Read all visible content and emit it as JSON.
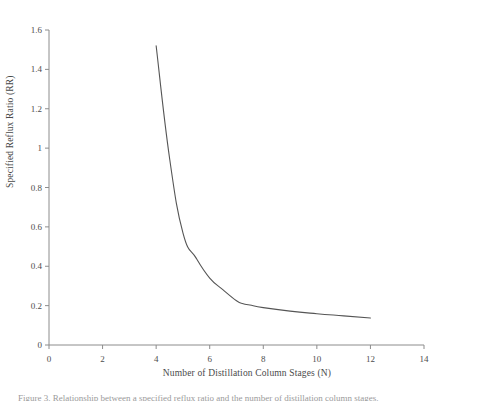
{
  "chart_data": {
    "type": "line",
    "title": "",
    "xlabel": "Number of Distillation Column Stages (N)",
    "ylabel": "Specified Reflux Ratio (RR)",
    "xlim": [
      0,
      14
    ],
    "ylim": [
      0,
      1.6
    ],
    "xticks": [
      "0",
      "2",
      "4",
      "6",
      "8",
      "10",
      "12",
      "14"
    ],
    "xtick_values": [
      0,
      2,
      4,
      6,
      8,
      10,
      12,
      14
    ],
    "yticks": [
      "0",
      "0.2",
      "0.4",
      "0.6",
      "0.8",
      "1",
      "1.2",
      "1.4",
      "1.6"
    ],
    "ytick_values": [
      0,
      0.2,
      0.4,
      0.6,
      0.8,
      1,
      1.2,
      1.4,
      1.6
    ],
    "grid": false,
    "legend": "none",
    "series": [
      {
        "name": "Specified Reflux Ratio",
        "color": "#555555",
        "x": [
          4.0,
          4.5,
          5.0,
          5.5,
          6.0,
          6.5,
          7.0,
          7.25,
          7.5,
          8.0,
          9.0,
          10.0,
          11.0,
          12.0
        ],
        "values": [
          1.52,
          0.95,
          0.57,
          0.44,
          0.34,
          0.28,
          0.225,
          0.21,
          0.203,
          0.19,
          0.172,
          0.159,
          0.148,
          0.137
        ]
      }
    ]
  },
  "axis": {
    "line_color": "#808080",
    "text_color": "#4a4a4a"
  },
  "caption": {
    "text": "Figure 3. Relationship between a specified reflux ratio and the number of distillation column stages."
  }
}
